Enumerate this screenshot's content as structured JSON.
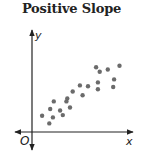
{
  "chart_data": {
    "type": "scatter",
    "title": "Positive Slope",
    "xlabel": "x",
    "ylabel": "y",
    "origin_label": "O",
    "grid": false,
    "legend": null,
    "xlim": [
      0,
      100
    ],
    "ylim": [
      0,
      100
    ],
    "points": [
      {
        "x": 9,
        "y": 16
      },
      {
        "x": 17,
        "y": 6
      },
      {
        "x": 18,
        "y": 25
      },
      {
        "x": 21,
        "y": 14
      },
      {
        "x": 22,
        "y": 35
      },
      {
        "x": 29,
        "y": 23
      },
      {
        "x": 32,
        "y": 17
      },
      {
        "x": 36,
        "y": 35
      },
      {
        "x": 37,
        "y": 39
      },
      {
        "x": 40,
        "y": 27
      },
      {
        "x": 43,
        "y": 48
      },
      {
        "x": 54,
        "y": 43
      },
      {
        "x": 51,
        "y": 56
      },
      {
        "x": 60,
        "y": 55
      },
      {
        "x": 71,
        "y": 51
      },
      {
        "x": 71,
        "y": 60
      },
      {
        "x": 88,
        "y": 54
      },
      {
        "x": 73,
        "y": 74
      },
      {
        "x": 89,
        "y": 64
      },
      {
        "x": 69,
        "y": 80
      },
      {
        "x": 82,
        "y": 77
      },
      {
        "x": 95,
        "y": 82
      }
    ],
    "trend": "positive"
  },
  "colors": {
    "points": "#6b6b6b",
    "axes": "#222222"
  }
}
